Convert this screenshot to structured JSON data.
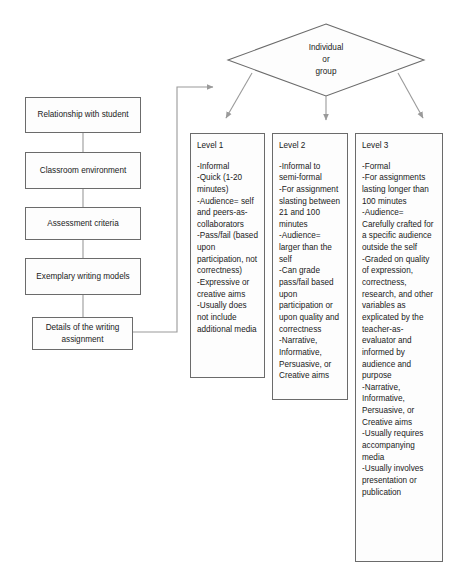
{
  "diagram": {
    "colors": {
      "box_border": "#6b6b6b",
      "box_fill": "#fdfdfd",
      "connector": "#8c8c8c",
      "text": "#1a1a1a"
    },
    "process_steps": [
      {
        "label": "Relationship with student"
      },
      {
        "label": "Classroom environment"
      },
      {
        "label": "Assessment criteria"
      },
      {
        "label": "Exemplary writing models"
      },
      {
        "label": "Details of the writing assignment"
      }
    ],
    "decision": {
      "line1": "Individual",
      "line2": "or",
      "line3": "group"
    },
    "levels": [
      {
        "title": "Level 1",
        "items": [
          "-Informal",
          "-Quick (1-20 minutes)",
          "-Audience= self and peers-as-collaborators",
          "-Pass/fail (based upon participation, not correctness)",
          "-Expressive or creative aims",
          "-Usually does not include additional media"
        ]
      },
      {
        "title": "Level 2",
        "items": [
          "-Informal to  semi-formal",
          "-For assignment slasting between 21 and 100 minutes",
          "-Audience= larger than the self",
          "-Can grade pass/fail based upon participation or upon quality and correctness",
          "-Narrative, Informative, Persuasive, or Creative aims"
        ]
      },
      {
        "title": "Level 3",
        "items": [
          "-Formal",
          "-For assignments lasting longer than 100 minutes",
          "-Audience= Carefully crafted for a specific audience outside the self",
          "-Graded on quality of expression, correctness, research, and other variables as explicated by the teacher-as-evaluator and informed by audience and purpose",
          "-Narrative, Informative, Persuasive, or Creative aims",
          "-Usually requires accompanying media",
          "-Usually involves presentation or publication"
        ]
      }
    ]
  }
}
